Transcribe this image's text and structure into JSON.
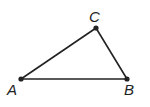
{
  "diagram": {
    "type": "triangle",
    "points": [
      {
        "name": "A",
        "x": 21,
        "y": 79,
        "label_x": 7,
        "label_y": 95
      },
      {
        "name": "B",
        "x": 127,
        "y": 79,
        "label_x": 124,
        "label_y": 95
      },
      {
        "name": "C",
        "x": 96,
        "y": 28,
        "label_x": 89,
        "label_y": 22
      }
    ],
    "segments": [
      [
        "A",
        "B"
      ],
      [
        "B",
        "C"
      ],
      [
        "C",
        "A"
      ]
    ],
    "stroke_color": "#222222"
  }
}
